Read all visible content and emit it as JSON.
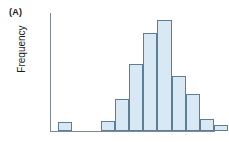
{
  "figure": {
    "panel_label": "(A)",
    "y_axis_label": "Frequency",
    "x_axis_label": "",
    "title": ""
  },
  "style": {
    "bar_fill": "#d8e9f5",
    "bar_stroke": "#5d7f95",
    "axis_color": "#7c8a93",
    "text_color": "#1a1a1a",
    "background": "#ffffff"
  },
  "chart_data": {
    "type": "bar",
    "title": "",
    "subtitle": "",
    "xlabel": "",
    "ylabel": "Frequency",
    "grid": false,
    "legend": "none",
    "xlim": [
      0,
      14
    ],
    "ylim": [
      0,
      115
    ],
    "note": "Histogram with one isolated low outlier bin at the far left, a gap, then a right-skewed unimodal mound peaking at bin 8.",
    "bin_width_px": 14.2,
    "categories": [
      "1",
      "2",
      "3",
      "4",
      "5",
      "6",
      "7",
      "8",
      "9",
      "10",
      "11",
      "12",
      "13"
    ],
    "values": [
      9,
      0,
      0,
      10,
      31,
      65,
      96,
      108,
      54,
      36,
      12,
      6,
      0
    ],
    "series": [
      {
        "name": "Frequency",
        "values": [
          9,
          0,
          0,
          10,
          31,
          65,
          96,
          108,
          54,
          36,
          12,
          6,
          0
        ]
      }
    ]
  }
}
